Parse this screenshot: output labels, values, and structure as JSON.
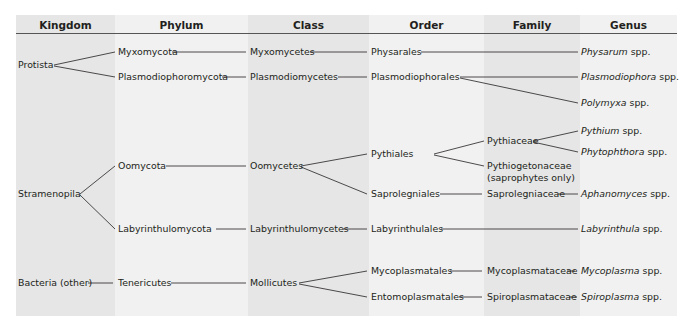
{
  "headers": [
    "Kingdom",
    "Phylum",
    "Class",
    "Order",
    "Family",
    "Genus"
  ],
  "kingdoms": [
    "Protista",
    "Stramenopila",
    "Bacteria (other)"
  ],
  "phyla": [
    "Myxomycota",
    "Plasmodiophoromycota",
    "Oomycota",
    "Labyrinthulomycota",
    "Tenericutes"
  ],
  "classes": [
    "Myxomycetes",
    "Plasmodiomycetes",
    "Oomycetes",
    "Labyrinthulomycetes",
    "Mollicutes"
  ],
  "orders": [
    "Physarales",
    "Plasmodiophorales",
    "Pythiales",
    "Saprolegniales",
    "Labyrinthulales",
    "Mycoplasmatales",
    "Entomoplasmatales"
  ],
  "families": [
    "Pythiaceae",
    "Pythiogetonaceae",
    "(saprophytes only)",
    "Saprolegniaceae",
    "Mycoplasmataceae",
    "Spiroplasmataceae"
  ],
  "genera": [
    {
      "name": "Physarum",
      "suffix": " spp."
    },
    {
      "name": "Plasmodiophora",
      "suffix": " spp."
    },
    {
      "name": "Polymyxa",
      "suffix": " spp."
    },
    {
      "name": "Pythium",
      "suffix": " spp."
    },
    {
      "name": "Phytophthora",
      "suffix": " spp."
    },
    {
      "name": "Aphanomyces",
      "suffix": " spp."
    },
    {
      "name": "Labyrinthula",
      "suffix": " spp."
    },
    {
      "name": "Mycoplasma",
      "suffix": " spp."
    },
    {
      "name": "Spiroplasma",
      "suffix": " spp."
    }
  ],
  "colors": {
    "shade": "#e6e6e6",
    "light": "#f1f1f1",
    "ink": "#231f20"
  }
}
